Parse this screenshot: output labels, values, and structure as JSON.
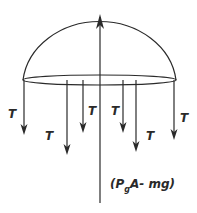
{
  "diagram": {
    "tension_label": "T",
    "force_label_prefix": "(P",
    "force_label_sub": "g",
    "force_label_suffix": "A- mg)",
    "colors": {
      "stroke": "#2a2a2a",
      "background": "#ffffff"
    },
    "tension_arrows": [
      {
        "x": 24,
        "y_end": 135,
        "label_x": 8,
        "label_y": 118
      },
      {
        "x": 67,
        "y_end": 155,
        "label_x": 45,
        "label_y": 140
      },
      {
        "x": 83,
        "y_end": 133,
        "label_x": 88,
        "label_y": 115
      },
      {
        "x": 123,
        "y_end": 133,
        "label_x": 111,
        "label_y": 115
      },
      {
        "x": 136,
        "y_end": 152,
        "label_x": 146,
        "label_y": 140
      },
      {
        "x": 174,
        "y_end": 140,
        "label_x": 180,
        "label_y": 122
      }
    ]
  }
}
